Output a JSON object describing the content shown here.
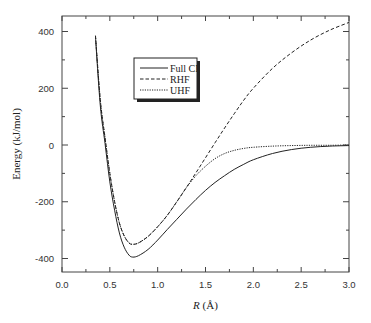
{
  "chart_data": {
    "type": "line",
    "title": "",
    "xlabel": "R (Å)",
    "xlabel_italic_part": "R",
    "xlabel_unit_part": "(Å)",
    "ylabel": "Energy (kJ/mol)",
    "xlim": [
      0.0,
      3.0
    ],
    "ylim": [
      -450,
      450
    ],
    "xticks": [
      0.0,
      0.5,
      1.0,
      1.5,
      2.0,
      2.5,
      3.0
    ],
    "xtick_labels": [
      "0.0",
      "0.5",
      "1.0",
      "1.5",
      "2.0",
      "2.5",
      "3.0"
    ],
    "xminor_ticks": [
      0.25,
      0.75,
      1.25,
      1.75,
      2.25,
      2.75
    ],
    "yticks": [
      -400,
      -200,
      0,
      200,
      400
    ],
    "ytick_labels": [
      "-400",
      "-200",
      "0",
      "200",
      "400"
    ],
    "yminor_ticks": [
      -300,
      -100,
      100,
      300
    ],
    "grid": false,
    "legend_position": "upper-left-inside",
    "series": [
      {
        "name": "Full CI",
        "style": "solid",
        "x": [
          0.35,
          0.4,
          0.45,
          0.5,
          0.55,
          0.6,
          0.65,
          0.7,
          0.74,
          0.8,
          0.9,
          1.0,
          1.1,
          1.2,
          1.3,
          1.4,
          1.5,
          1.6,
          1.7,
          1.8,
          1.9,
          2.0,
          2.2,
          2.4,
          2.6,
          2.8,
          3.0
        ],
        "values": [
          380,
          140,
          5,
          -130,
          -230,
          -310,
          -360,
          -388,
          -395,
          -390,
          -368,
          -335,
          -298,
          -262,
          -226,
          -192,
          -160,
          -132,
          -108,
          -86,
          -68,
          -52,
          -30,
          -16,
          -8,
          -4,
          -2
        ]
      },
      {
        "name": "RHF",
        "style": "dashed",
        "x": [
          0.35,
          0.4,
          0.45,
          0.5,
          0.55,
          0.6,
          0.65,
          0.7,
          0.74,
          0.8,
          0.9,
          1.0,
          1.1,
          1.2,
          1.3,
          1.4,
          1.5,
          1.6,
          1.7,
          1.8,
          1.9,
          2.0,
          2.2,
          2.4,
          2.6,
          2.8,
          3.0
        ],
        "values": [
          385,
          160,
          25,
          -100,
          -200,
          -275,
          -320,
          -345,
          -350,
          -345,
          -322,
          -288,
          -248,
          -200,
          -150,
          -98,
          -45,
          8,
          60,
          110,
          158,
          200,
          270,
          325,
          370,
          405,
          432
        ]
      },
      {
        "name": "UHF",
        "style": "dotted",
        "x": [
          0.35,
          0.4,
          0.45,
          0.5,
          0.55,
          0.6,
          0.65,
          0.7,
          0.74,
          0.8,
          0.9,
          1.0,
          1.1,
          1.2,
          1.25,
          1.3,
          1.4,
          1.5,
          1.6,
          1.7,
          1.8,
          1.9,
          2.0,
          2.2,
          2.4,
          2.6,
          2.8,
          3.0
        ],
        "values": [
          385,
          160,
          25,
          -100,
          -200,
          -275,
          -320,
          -345,
          -350,
          -345,
          -322,
          -288,
          -248,
          -200,
          -175,
          -150,
          -108,
          -75,
          -48,
          -30,
          -19,
          -12,
          -8,
          -4,
          -2,
          -1,
          -1,
          0
        ]
      }
    ]
  },
  "legend": {
    "items": [
      {
        "label": "Full CI",
        "style": "solid"
      },
      {
        "label": "RHF",
        "style": "dashed"
      },
      {
        "label": "UHF",
        "style": "dotted"
      }
    ]
  },
  "axes": {
    "x_label_italic": "R",
    "x_label_unit": " (Å)",
    "y_label": "Energy (kJ/mol)"
  },
  "colors": {
    "line": "#222222",
    "axis": "#444444",
    "background": "#ffffff"
  }
}
